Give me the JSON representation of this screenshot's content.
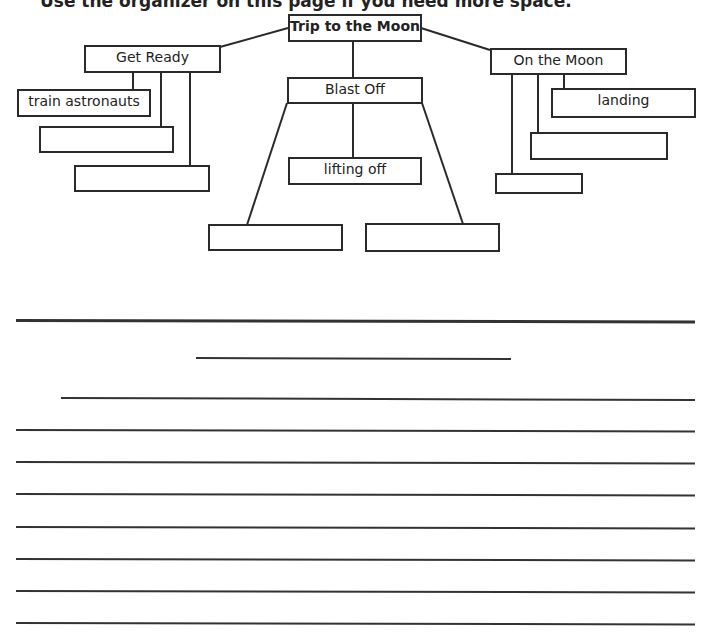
{
  "heading": "Use the organizer on this page if you need more space.",
  "organizer": {
    "root": "Trip to the Moon",
    "branches": [
      {
        "title": "Get Ready",
        "children": [
          "train astronauts",
          "",
          ""
        ]
      },
      {
        "title": "Blast Off",
        "children": [
          "lifting off",
          "",
          ""
        ]
      },
      {
        "title": "On the Moon",
        "children": [
          "landing",
          "",
          ""
        ]
      }
    ]
  },
  "writing_area": {
    "title_line_count": 1,
    "line_count": 9
  }
}
